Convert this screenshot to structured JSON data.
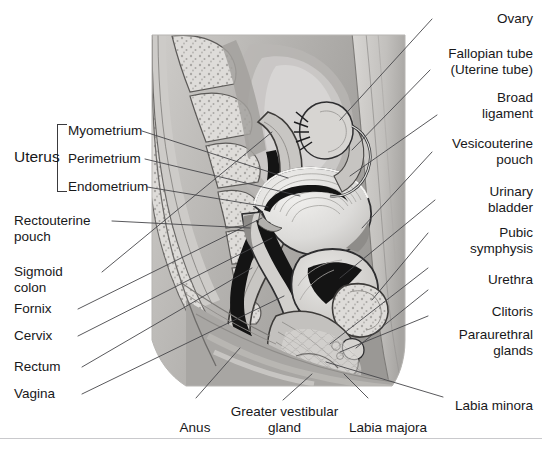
{
  "figure": {
    "illustration_name": "female-reproductive-system-sagittal-illustration",
    "palette": {
      "background": "#ffffff",
      "leader_line": "#46464a",
      "text": "#18181a",
      "rule": "#c9c9cc",
      "tissue_light": "#e3e2e0",
      "tissue_mid": "#b9b7b4",
      "tissue_dark": "#8e8c89",
      "tissue_darker": "#6e6c6a",
      "lumen_black": "#111111",
      "outline": "#2e2e30"
    }
  },
  "group_labels": [
    {
      "name": "uterus-group-label",
      "text": "Uterus"
    }
  ],
  "labels_left": [
    {
      "name": "label-myometrium",
      "text": "Myometrium"
    },
    {
      "name": "label-perimetrium",
      "text": "Perimetrium"
    },
    {
      "name": "label-endometrium",
      "text": "Endometrium"
    },
    {
      "name": "label-rectouterine-pouch",
      "text": "Rectouterine\npouch"
    },
    {
      "name": "label-sigmoid-colon",
      "text": "Sigmoid\ncolon"
    },
    {
      "name": "label-fornix",
      "text": "Fornix"
    },
    {
      "name": "label-cervix",
      "text": "Cervix"
    },
    {
      "name": "label-rectum",
      "text": "Rectum"
    },
    {
      "name": "label-vagina",
      "text": "Vagina"
    }
  ],
  "labels_right": [
    {
      "name": "label-ovary",
      "text": "Ovary"
    },
    {
      "name": "label-fallopian-tube",
      "text": "Fallopian tube\n(Uterine tube)"
    },
    {
      "name": "label-broad-ligament",
      "text": "Broad\nligament"
    },
    {
      "name": "label-vesicouterine-pouch",
      "text": "Vesicouterine\npouch"
    },
    {
      "name": "label-urinary-bladder",
      "text": "Urinary\nbladder"
    },
    {
      "name": "label-pubic-symphysis",
      "text": "Pubic\nsymphysis"
    },
    {
      "name": "label-urethra",
      "text": "Urethra"
    },
    {
      "name": "label-clitoris",
      "text": "Clitoris"
    },
    {
      "name": "label-paraurethral-glands",
      "text": "Paraurethral\nglands"
    },
    {
      "name": "label-labia-minora",
      "text": "Labia minora"
    }
  ],
  "labels_bottom": [
    {
      "name": "label-anus",
      "text": "Anus"
    },
    {
      "name": "label-greater-vestibular-gland",
      "text": "Greater vestibular\ngland"
    },
    {
      "name": "label-labia-majora",
      "text": "Labia majora"
    }
  ]
}
